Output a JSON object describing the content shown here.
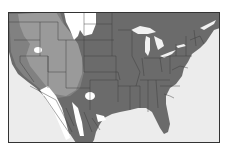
{
  "map": {
    "subject": "North America range / distribution map",
    "region": "Contiguous United States and northern Mexico",
    "colors": {
      "ocean": "#ececec",
      "land_base": "#6b6b6b",
      "range_light": "#9a9a9a",
      "range_medium": "#818181",
      "absent_white": "#ffffff",
      "lakes": "#f2f2f2",
      "border": "#333333"
    },
    "legend": [],
    "labels": []
  }
}
